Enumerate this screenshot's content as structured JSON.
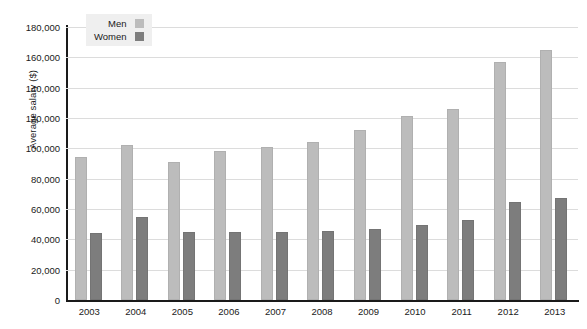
{
  "chart_data": {
    "type": "bar",
    "title": "",
    "xlabel": "",
    "ylabel": "Average salary ($)",
    "categories": [
      "2003",
      "2004",
      "2005",
      "2006",
      "2007",
      "2008",
      "2009",
      "2010",
      "2011",
      "2012",
      "2013"
    ],
    "series": [
      {
        "name": "Men",
        "color": "#bcbcbc",
        "values": [
          94000,
          102000,
          91000,
          98000,
          101000,
          104500,
          112000,
          121000,
          126000,
          157000,
          165000
        ]
      },
      {
        "name": "Women",
        "color": "#7d7d7d",
        "values": [
          44000,
          55000,
          45000,
          45000,
          45000,
          45500,
          46500,
          49500,
          53000,
          64500,
          67500
        ]
      }
    ],
    "ylim": [
      0,
      180000
    ],
    "ytick_values": [
      0,
      20000,
      40000,
      60000,
      80000,
      100000,
      120000,
      140000,
      160000,
      180000
    ],
    "ytick_labels": [
      "0",
      "20,000",
      "40,000",
      "60,000",
      "80,000",
      "100,000",
      "120,000",
      "140,000",
      "160,000",
      "180,000"
    ],
    "grid": true,
    "grid_color": "#dcdcdc",
    "legend_position": "top-left",
    "legend_background": "#efefef",
    "axis_color": "#1a1a1a",
    "background": "#ffffff"
  },
  "legend": {
    "items": [
      {
        "label": "Men",
        "swatch": "men-swatch-icon"
      },
      {
        "label": "Women",
        "swatch": "women-swatch-icon"
      }
    ]
  }
}
